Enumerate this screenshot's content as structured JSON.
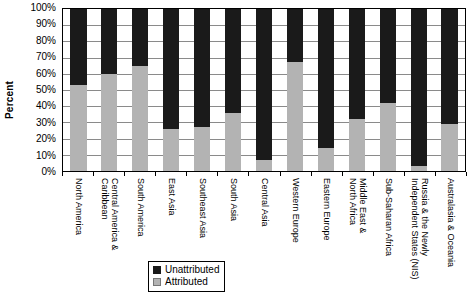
{
  "chart_data": {
    "type": "bar",
    "subtype": "stacked-100-percent",
    "title": "",
    "xlabel": "",
    "ylabel": "Percent",
    "ylim": [
      0,
      100
    ],
    "ytick_labels": [
      "100%",
      "90%",
      "80%",
      "70%",
      "60%",
      "50%",
      "40%",
      "30%",
      "20%",
      "10%",
      "0%"
    ],
    "ytick_values": [
      100,
      90,
      80,
      70,
      60,
      50,
      40,
      30,
      20,
      10,
      0
    ],
    "grid": true,
    "legend_position": "bottom-center",
    "categories": [
      "North America",
      "Central America & Caribbean",
      "South America",
      "East Asia",
      "Southeast Asia",
      "South Asia",
      "Central Asia",
      "Western Europe",
      "Eastern Europe",
      "Middle East & North Africa",
      "Sub-Saharan Africa",
      "Russia & the Newly Independent States (NIS)",
      "Australasia & Oceania"
    ],
    "series": [
      {
        "name": "Attributed",
        "color": "#b3b3b3",
        "values": [
          53,
          60,
          65,
          26,
          27,
          36,
          7,
          67,
          14,
          32,
          42,
          3,
          29
        ]
      },
      {
        "name": "Unattributed",
        "color": "#1a1a1a",
        "values": [
          47,
          40,
          35,
          74,
          73,
          64,
          93,
          33,
          86,
          68,
          58,
          97,
          71
        ]
      }
    ],
    "legend": [
      {
        "label": "Unattributed",
        "color": "#1a1a1a"
      },
      {
        "label": "Attributed",
        "color": "#b3b3b3"
      }
    ]
  },
  "category_label_lines": [
    [
      "North America"
    ],
    [
      "Central America &",
      "Caribbean"
    ],
    [
      "South America"
    ],
    [
      "East Asia"
    ],
    [
      "Southeast Asia"
    ],
    [
      "South Asia"
    ],
    [
      "Central Asia"
    ],
    [
      "Western Europe"
    ],
    [
      "Eastern Europe"
    ],
    [
      "Middle East &",
      "North Africa"
    ],
    [
      "Sub-Saharan Africa"
    ],
    [
      "Russia & the Newly",
      "Independent States (NIS)"
    ],
    [
      "Australasia & Oceania"
    ]
  ]
}
